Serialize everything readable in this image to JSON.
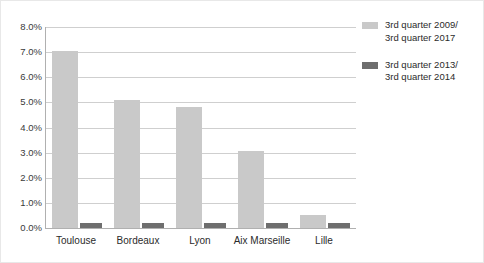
{
  "chart_data": {
    "type": "bar",
    "title": "",
    "subtitle": "",
    "xlabel": "",
    "ylabel": "",
    "categories": [
      "Toulouse",
      "Bordeaux",
      "Lyon",
      "Aix Marseille",
      "Lille"
    ],
    "series": [
      {
        "name": "3rd quarter 2009/\n3rd quarter 2017",
        "color": "#c9c9c9",
        "values": [
          7.05,
          5.1,
          4.8,
          3.05,
          0.5
        ]
      },
      {
        "name": "3rd quarter 2013/\n3rd quarter 2014",
        "color": "#6e6e6e",
        "values": [
          0.2,
          0.2,
          0.2,
          0.2,
          0.2
        ]
      }
    ],
    "ylim": [
      0.0,
      8.0
    ],
    "ytick_values": [
      0.0,
      1.0,
      2.0,
      3.0,
      4.0,
      5.0,
      6.0,
      7.0,
      8.0
    ],
    "ytick_labels": [
      "0.0%",
      "1.0%",
      "2.0%",
      "3.0%",
      "4.0%",
      "5.0%",
      "6.0%",
      "7.0%",
      "8.0%"
    ],
    "grid": true,
    "grid_axis": "y",
    "legend_position": "right",
    "legend_entries": [
      "3rd quarter 2009/\n3rd quarter 2017",
      "3rd quarter 2013/\n3rd quarter 2014"
    ]
  },
  "colors": {
    "series_light": "#c9c9c9",
    "series_dark": "#6e6e6e",
    "gridline": "#cfcfcf",
    "axis": "#b0b0b0",
    "text": "#2b2b2b",
    "background": "#ffffff",
    "frame": "#e8e8e8"
  }
}
